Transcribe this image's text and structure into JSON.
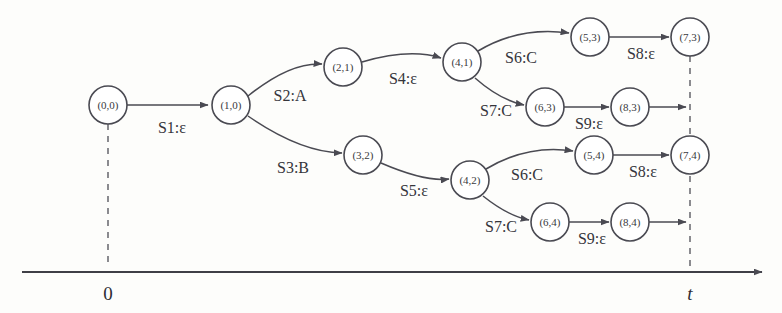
{
  "diagram": {
    "nodes": [
      {
        "id": "n00",
        "label": "(0,0)",
        "x": 108,
        "y": 105,
        "r": 19
      },
      {
        "id": "n10",
        "label": "(1,0)",
        "x": 231,
        "y": 105,
        "r": 19
      },
      {
        "id": "n21",
        "label": "(2,1)",
        "x": 343,
        "y": 67,
        "r": 19
      },
      {
        "id": "n32",
        "label": "(3,2)",
        "x": 363,
        "y": 155,
        "r": 19
      },
      {
        "id": "n41",
        "label": "(4,1)",
        "x": 462,
        "y": 62,
        "r": 19
      },
      {
        "id": "n42",
        "label": "(4,2)",
        "x": 470,
        "y": 180,
        "r": 19
      },
      {
        "id": "n53",
        "label": "(5,3)",
        "x": 590,
        "y": 37,
        "r": 19
      },
      {
        "id": "n63",
        "label": "(6,3)",
        "x": 545,
        "y": 107,
        "r": 19
      },
      {
        "id": "n73",
        "label": "(7,3)",
        "x": 690,
        "y": 37,
        "r": 19
      },
      {
        "id": "n83",
        "label": "(8,3)",
        "x": 630,
        "y": 107,
        "r": 19
      },
      {
        "id": "n54",
        "label": "(5,4)",
        "x": 594,
        "y": 155,
        "r": 19
      },
      {
        "id": "n64",
        "label": "(6,4)",
        "x": 550,
        "y": 222,
        "r": 19
      },
      {
        "id": "n74",
        "label": "(7,4)",
        "x": 690,
        "y": 155,
        "r": 19
      },
      {
        "id": "n84",
        "label": "(8,4)",
        "x": 630,
        "y": 222,
        "r": 19
      }
    ],
    "edges": [
      {
        "id": "e1",
        "from": "n00",
        "to": "n10",
        "label": "S1:ε",
        "label_x": 172,
        "label_y": 129,
        "path": "M 127 105 L 208 105",
        "arrow": true
      },
      {
        "id": "e2",
        "from": "n10",
        "to": "n21",
        "label": "S2:A",
        "label_x": 290,
        "label_y": 97,
        "path": "M 248 96 Q 290 62 322 64",
        "arrow": true
      },
      {
        "id": "e3",
        "from": "n10",
        "to": "n32",
        "label": "S3:B",
        "label_x": 293,
        "label_y": 169,
        "path": "M 248 116 Q 300 152 342 153",
        "arrow": true
      },
      {
        "id": "e4",
        "from": "n21",
        "to": "n41",
        "label": "S4:ε",
        "label_x": 403,
        "label_y": 80,
        "path": "M 362 62 Q 410 48 441 58",
        "arrow": true
      },
      {
        "id": "e5",
        "from": "n32",
        "to": "n42",
        "label": "S5:ε",
        "label_x": 414,
        "label_y": 192,
        "path": "M 381 163 Q 425 182 449 179",
        "arrow": true
      },
      {
        "id": "e6",
        "from": "n41",
        "to": "n53",
        "label": "S6:C",
        "label_x": 521,
        "label_y": 59,
        "path": "M 478 51 Q 520 26 569 33",
        "arrow": true
      },
      {
        "id": "e7",
        "from": "n41",
        "to": "n63",
        "label": "S7:C",
        "label_x": 496,
        "label_y": 112,
        "path": "M 475 78 Q 500 100 524 105",
        "arrow": true
      },
      {
        "id": "e8",
        "from": "n53",
        "to": "n73",
        "label": "S8:ε",
        "label_x": 641,
        "label_y": 55,
        "path": "M 609 37 L 669 37",
        "arrow": true
      },
      {
        "id": "e9",
        "from": "n63",
        "to": "n83",
        "label": "S9:ε",
        "label_x": 589,
        "label_y": 125,
        "path": "M 564 107 L 609 107",
        "arrow": true
      },
      {
        "id": "e10",
        "from": "n83",
        "to": "axis",
        "label": "",
        "label_x": 0,
        "label_y": 0,
        "path": "M 649 107 L 686 107",
        "arrow": true
      },
      {
        "id": "e11",
        "from": "n42",
        "to": "n54",
        "label": "S6:C",
        "label_x": 527,
        "label_y": 176,
        "path": "M 486 169 Q 528 144 573 151",
        "arrow": true
      },
      {
        "id": "e12",
        "from": "n42",
        "to": "n64",
        "label": "S7:C",
        "label_x": 501,
        "label_y": 228,
        "path": "M 483 196 Q 508 216 529 220",
        "arrow": true
      },
      {
        "id": "e13",
        "from": "n54",
        "to": "n74",
        "label": "S8:ε",
        "label_x": 643,
        "label_y": 173,
        "path": "M 613 155 L 669 155",
        "arrow": true
      },
      {
        "id": "e14",
        "from": "n64",
        "to": "n84",
        "label": "S9:ε",
        "label_x": 592,
        "label_y": 240,
        "path": "M 569 222 L 609 222",
        "arrow": true
      },
      {
        "id": "e15",
        "from": "n84",
        "to": "axis",
        "label": "",
        "label_x": 0,
        "label_y": 0,
        "path": "M 649 222 L 686 222",
        "arrow": true
      }
    ],
    "guides": [
      {
        "id": "g0",
        "from_x": 108,
        "from_y": 124,
        "to_x": 108,
        "to_y": 268
      },
      {
        "id": "gt",
        "from_x": 690,
        "from_y": 56,
        "to_x": 690,
        "to_y": 268
      }
    ],
    "axis": {
      "start_x": 22,
      "end_x": 762,
      "y": 272,
      "ticks": [
        {
          "id": "tick-zero",
          "label": "0",
          "x": 108,
          "y": 300,
          "italic": false
        },
        {
          "id": "tick-t",
          "label": "t",
          "x": 690,
          "y": 300,
          "italic": true
        }
      ]
    }
  }
}
